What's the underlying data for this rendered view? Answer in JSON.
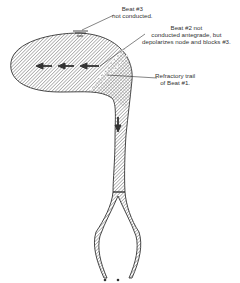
{
  "diagram": {
    "colors": {
      "stroke": "#333333",
      "hatch": "#555555",
      "background": "#ffffff"
    },
    "labels": {
      "beat3": {
        "line1": "Beat #3",
        "line2": "not conducted."
      },
      "beat2": {
        "line1": "Beat #2 not",
        "line2": "conducted antegrade, but",
        "line3": "depolarizes node and blocks #3."
      },
      "refractory": {
        "line1": "Refractory trail",
        "line2": "of Beat #1."
      }
    },
    "arrows": {
      "count_left": 3,
      "count_down": 1
    }
  }
}
